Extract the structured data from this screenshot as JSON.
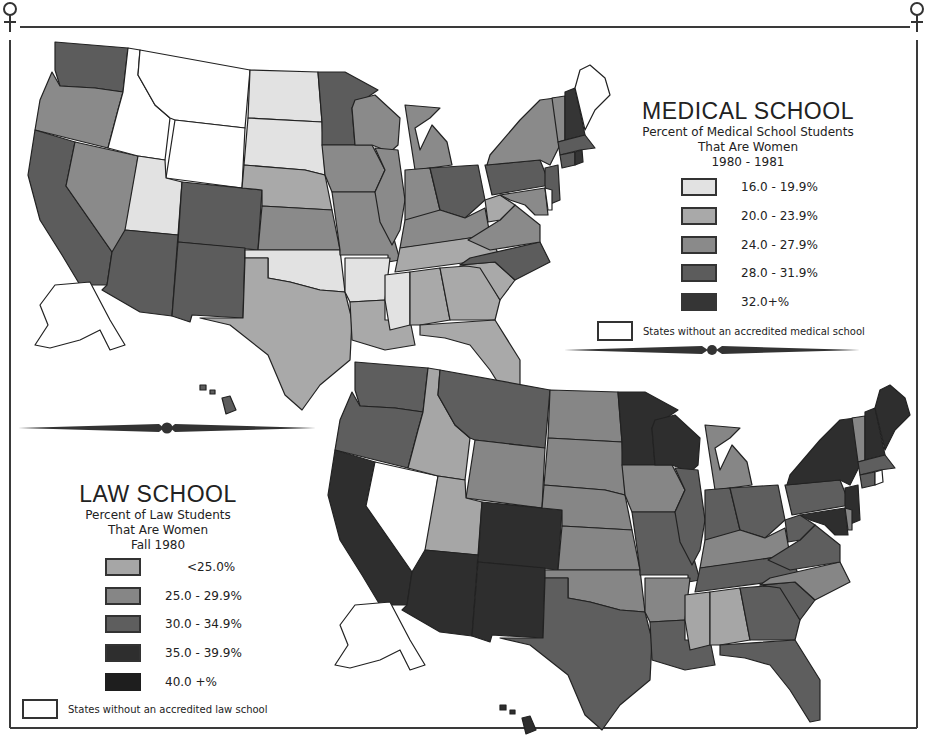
{
  "chart_data": [
    {
      "type": "choropleth",
      "title": "MEDICAL SCHOOL",
      "subtitle": [
        "Percent of Medical School Students",
        "That Are Women",
        "1980 - 1981"
      ],
      "legend": [
        {
          "label": "16.0 - 19.9%",
          "color": "#e2e2e2"
        },
        {
          "label": "20.0 - 23.9%",
          "color": "#a9a9a9"
        },
        {
          "label": "24.0 - 27.9%",
          "color": "#8a8a8a"
        },
        {
          "label": "28.0 - 31.9%",
          "color": "#5c5c5c"
        },
        {
          "label": "32.0+%",
          "color": "#353535"
        }
      ],
      "no_data_label": "States without an accredited medical school",
      "states": {
        "WA": "28.0 - 31.9%",
        "OR": "24.0 - 27.9%",
        "CA": "28.0 - 31.9%",
        "NV": "24.0 - 27.9%",
        "ID": "none",
        "MT": "none",
        "WY": "none",
        "UT": "16.0 - 19.9%",
        "CO": "28.0 - 31.9%",
        "AZ": "28.0 - 31.9%",
        "NM": "28.0 - 31.9%",
        "ND": "16.0 - 19.9%",
        "SD": "16.0 - 19.9%",
        "NE": "20.0 - 23.9%",
        "KS": "24.0 - 27.9%",
        "OK": "16.0 - 19.9%",
        "TX": "20.0 - 23.9%",
        "MN": "28.0 - 31.9%",
        "IA": "24.0 - 27.9%",
        "MO": "24.0 - 27.9%",
        "AR": "16.0 - 19.9%",
        "LA": "20.0 - 23.9%",
        "WI": "24.0 - 27.9%",
        "IL": "24.0 - 27.9%",
        "MI": "24.0 - 27.9%",
        "IN": "24.0 - 27.9%",
        "OH": "28.0 - 31.9%",
        "KY": "24.0 - 27.9%",
        "TN": "20.0 - 23.9%",
        "MS": "16.0 - 19.9%",
        "AL": "20.0 - 23.9%",
        "GA": "20.0 - 23.9%",
        "FL": "20.0 - 23.9%",
        "SC": "20.0 - 23.9%",
        "NC": "28.0 - 31.9%",
        "VA": "24.0 - 27.9%",
        "WV": "20.0 - 23.9%",
        "PA": "28.0 - 31.9%",
        "NY": "24.0 - 27.9%",
        "NJ": "28.0 - 31.9%",
        "MD": "24.0 - 27.9%",
        "DE": "none",
        "VT": "24.0 - 27.9%",
        "NH": "32.0+%",
        "ME": "none",
        "MA": "28.0 - 31.9%",
        "CT": "28.0 - 31.9%",
        "RI": "32.0+%",
        "AK": "none",
        "HI": "28.0 - 31.9%"
      }
    },
    {
      "type": "choropleth",
      "title": "LAW SCHOOL",
      "subtitle": [
        "Percent of Law Students",
        "That Are Women",
        "Fall 1980"
      ],
      "legend": [
        {
          "label": "<25.0%",
          "color": "#a6a6a6"
        },
        {
          "label": "25.0 - 29.9%",
          "color": "#868686"
        },
        {
          "label": "30.0 - 34.9%",
          "color": "#5e5e5e"
        },
        {
          "label": "35.0 - 39.9%",
          "color": "#2e2e2e"
        },
        {
          "label": "40.0 +%",
          "color": "#1e1e1e"
        }
      ],
      "no_data_label": "States without an accredited law school",
      "states": {
        "WA": "30.0 - 34.9%",
        "OR": "30.0 - 34.9%",
        "CA": "35.0 - 39.9%",
        "NV": "none",
        "ID": "<25.0%",
        "MT": "30.0 - 34.9%",
        "WY": "25.0 - 29.9%",
        "UT": "<25.0%",
        "CO": "35.0 - 39.9%",
        "AZ": "35.0 - 39.9%",
        "NM": "35.0 - 39.9%",
        "ND": "25.0 - 29.9%",
        "SD": "25.0 - 29.9%",
        "NE": "25.0 - 29.9%",
        "KS": "25.0 - 29.9%",
        "OK": "25.0 - 29.9%",
        "TX": "30.0 - 34.9%",
        "MN": "35.0 - 39.9%",
        "IA": "25.0 - 29.9%",
        "MO": "30.0 - 34.9%",
        "AR": "25.0 - 29.9%",
        "LA": "30.0 - 34.9%",
        "WI": "35.0 - 39.9%",
        "IL": "30.0 - 34.9%",
        "MI": "25.0 - 29.9%",
        "IN": "30.0 - 34.9%",
        "OH": "30.0 - 34.9%",
        "KY": "25.0 - 29.9%",
        "TN": "30.0 - 34.9%",
        "MS": "<25.0%",
        "AL": "<25.0%",
        "GA": "30.0 - 34.9%",
        "FL": "30.0 - 34.9%",
        "SC": "30.0 - 34.9%",
        "NC": "25.0 - 29.9%",
        "VA": "30.0 - 34.9%",
        "WV": "30.0 - 34.9%",
        "PA": "30.0 - 34.9%",
        "NY": "35.0 - 39.9%",
        "NJ": "35.0 - 39.9%",
        "MD": "35.0 - 39.9%",
        "DE": "25.0 - 29.9%",
        "VT": "25.0 - 29.9%",
        "NH": "35.0 - 39.9%",
        "ME": "35.0 - 39.9%",
        "MA": "30.0 - 34.9%",
        "CT": "30.0 - 34.9%",
        "RI": "none",
        "AK": "none",
        "HI": "35.0 - 39.9%"
      }
    }
  ],
  "medical": {
    "title": "MEDICAL SCHOOL",
    "sub1": "Percent of Medical School Students",
    "sub2": "That Are Women",
    "sub3": "1980 - 1981",
    "legend": [
      {
        "label": "16.0 - 19.9%"
      },
      {
        "label": "20.0 - 23.9%"
      },
      {
        "label": "24.0 - 27.9%"
      },
      {
        "label": "28.0 - 31.9%"
      },
      {
        "label": "32.0+%"
      }
    ],
    "none_label": "States without an accredited medical school"
  },
  "law": {
    "title": "LAW SCHOOL",
    "sub1": "Percent of Law Students",
    "sub2": "That Are Women",
    "sub3": "Fall 1980",
    "legend": [
      {
        "label": "<25.0%"
      },
      {
        "label": "25.0 - 29.9%"
      },
      {
        "label": "30.0 - 34.9%"
      },
      {
        "label": "35.0 - 39.9%"
      },
      {
        "label": "40.0 +%"
      }
    ],
    "none_label": "States without an accredited law school"
  },
  "colors": {
    "med": [
      "#e2e2e2",
      "#a9a9a9",
      "#8a8a8a",
      "#5c5c5c",
      "#353535"
    ],
    "law": [
      "#a6a6a6",
      "#868686",
      "#5e5e5e",
      "#2e2e2e",
      "#1e1e1e"
    ],
    "none": "#ffffff",
    "stroke": "#222222"
  }
}
